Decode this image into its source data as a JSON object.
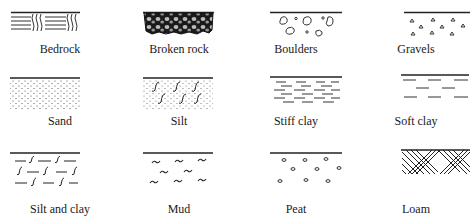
{
  "legend": {
    "title": "Soil and rock symbols",
    "items": [
      {
        "id": "bedrock",
        "label": "Bedrock"
      },
      {
        "id": "broken-rock",
        "label": "Broken rock"
      },
      {
        "id": "boulders",
        "label": "Boulders"
      },
      {
        "id": "gravels",
        "label": "Gravels"
      },
      {
        "id": "sand",
        "label": "Sand"
      },
      {
        "id": "silt",
        "label": "Silt"
      },
      {
        "id": "stiff-clay",
        "label": "Stiff clay"
      },
      {
        "id": "soft-clay",
        "label": "Soft clay"
      },
      {
        "id": "silt-and-clay",
        "label": "Silt and clay"
      },
      {
        "id": "mud",
        "label": "Mud"
      },
      {
        "id": "peat",
        "label": "Peat"
      },
      {
        "id": "loam",
        "label": "Loam"
      }
    ]
  }
}
